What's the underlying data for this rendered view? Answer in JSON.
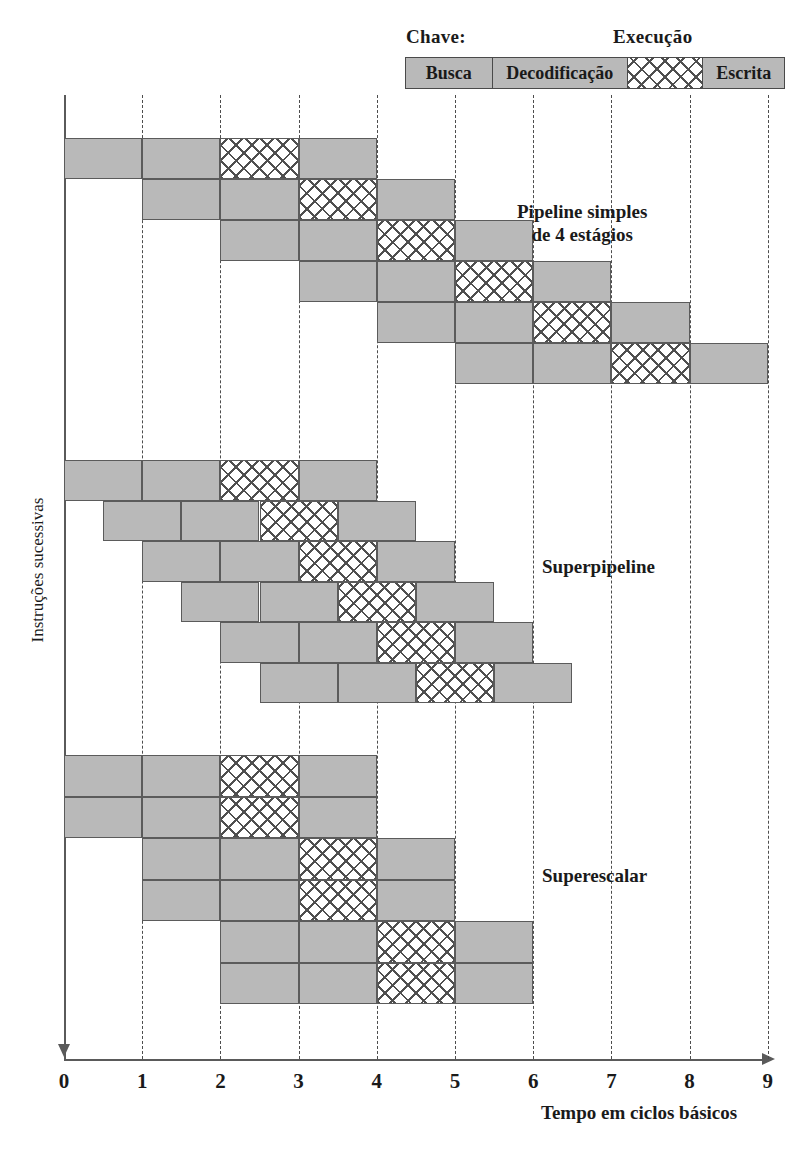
{
  "legend": {
    "key_label": "Chave:",
    "execution_label": "Execução",
    "cells": [
      {
        "name": "Busca",
        "pattern": "solid",
        "width_px": 86
      },
      {
        "name": "Decodificação",
        "pattern": "solid",
        "width_px": 136
      },
      {
        "name": "",
        "pattern": "hatch",
        "width_px": 76
      },
      {
        "name": "Escrita",
        "pattern": "solid",
        "width_px": 82
      }
    ]
  },
  "axes": {
    "x_caption": "Tempo em ciclos básicos",
    "y_caption": "Instruções sucessivas",
    "x_ticks": [
      "0",
      "1",
      "2",
      "3",
      "4",
      "5",
      "6",
      "7",
      "8",
      "9"
    ],
    "x_min": 0,
    "x_max": 9,
    "grid": "dashed-vertical"
  },
  "colors": {
    "fill_gray": "#b9b9b9",
    "stroke": "#5b5b5b",
    "axis": "#5a5a5a",
    "text": "#1a1a1a"
  },
  "chart_data": {
    "type": "bar",
    "title": "",
    "xlabel": "Tempo em ciclos básicos",
    "ylabel": "Instruções sucessivas",
    "xlim": [
      0,
      9
    ],
    "grid": true,
    "legend_position": "top-right",
    "stage_names": [
      "Busca",
      "Decodificação",
      "Execução",
      "Escrita"
    ],
    "stage_patterns": [
      "solid",
      "solid",
      "hatch",
      "solid"
    ],
    "groups": [
      {
        "label": "Pipeline simples\nde 4 estágios",
        "label_lines": [
          "Pipeline simples",
          "de 4 estágios"
        ],
        "row_count": 6,
        "rows": [
          {
            "start": 0,
            "stages": [
              [
                0,
                1
              ],
              [
                1,
                2
              ],
              [
                2,
                3
              ],
              [
                3,
                4
              ]
            ]
          },
          {
            "start": 1,
            "stages": [
              [
                1,
                2
              ],
              [
                2,
                3
              ],
              [
                3,
                4
              ],
              [
                4,
                5
              ]
            ]
          },
          {
            "start": 2,
            "stages": [
              [
                2,
                3
              ],
              [
                3,
                4
              ],
              [
                4,
                5
              ],
              [
                5,
                6
              ]
            ]
          },
          {
            "start": 3,
            "stages": [
              [
                3,
                4
              ],
              [
                4,
                5
              ],
              [
                5,
                6
              ],
              [
                6,
                7
              ]
            ]
          },
          {
            "start": 4,
            "stages": [
              [
                4,
                5
              ],
              [
                5,
                6
              ],
              [
                6,
                7
              ],
              [
                7,
                8
              ]
            ]
          },
          {
            "start": 5,
            "stages": [
              [
                5,
                6
              ],
              [
                6,
                7
              ],
              [
                7,
                8
              ],
              [
                8,
                9
              ]
            ]
          }
        ]
      },
      {
        "label": "Superpipeline",
        "label_lines": [
          "Superpipeline"
        ],
        "row_count": 6,
        "rows": [
          {
            "start": 0.0,
            "stages": [
              [
                0.0,
                1.0
              ],
              [
                1.0,
                2.0
              ],
              [
                2.0,
                3.0
              ],
              [
                3.0,
                4.0
              ]
            ]
          },
          {
            "start": 0.5,
            "stages": [
              [
                0.5,
                1.5
              ],
              [
                1.5,
                2.5
              ],
              [
                2.5,
                3.5
              ],
              [
                3.5,
                4.5
              ]
            ]
          },
          {
            "start": 1.0,
            "stages": [
              [
                1.0,
                2.0
              ],
              [
                2.0,
                3.0
              ],
              [
                3.0,
                4.0
              ],
              [
                4.0,
                5.0
              ]
            ]
          },
          {
            "start": 1.5,
            "stages": [
              [
                1.5,
                2.5
              ],
              [
                2.5,
                3.5
              ],
              [
                3.5,
                4.5
              ],
              [
                4.5,
                5.5
              ]
            ]
          },
          {
            "start": 2.0,
            "stages": [
              [
                2.0,
                3.0
              ],
              [
                3.0,
                4.0
              ],
              [
                4.0,
                5.0
              ],
              [
                5.0,
                6.0
              ]
            ]
          },
          {
            "start": 2.5,
            "stages": [
              [
                2.5,
                3.5
              ],
              [
                3.5,
                4.5
              ],
              [
                4.5,
                5.5
              ],
              [
                5.5,
                6.5
              ]
            ]
          }
        ]
      },
      {
        "label": "Superescalar",
        "label_lines": [
          "Superescalar"
        ],
        "row_count": 6,
        "rows": [
          {
            "start": 0,
            "stages": [
              [
                0,
                1
              ],
              [
                1,
                2
              ],
              [
                2,
                3
              ],
              [
                3,
                4
              ]
            ]
          },
          {
            "start": 0,
            "stages": [
              [
                0,
                1
              ],
              [
                1,
                2
              ],
              [
                2,
                3
              ],
              [
                3,
                4
              ]
            ]
          },
          {
            "start": 1,
            "stages": [
              [
                1,
                2
              ],
              [
                2,
                3
              ],
              [
                3,
                4
              ],
              [
                4,
                5
              ]
            ]
          },
          {
            "start": 1,
            "stages": [
              [
                1,
                2
              ],
              [
                2,
                3
              ],
              [
                3,
                4
              ],
              [
                4,
                5
              ]
            ]
          },
          {
            "start": 2,
            "stages": [
              [
                2,
                3
              ],
              [
                3,
                4
              ],
              [
                4,
                5
              ],
              [
                5,
                6
              ]
            ]
          },
          {
            "start": 2,
            "stages": [
              [
                2,
                3
              ],
              [
                3,
                4
              ],
              [
                4,
                5
              ],
              [
                5,
                6
              ]
            ]
          }
        ]
      }
    ]
  },
  "geometry": {
    "x0_px": 64,
    "unit_px": 78.2,
    "groups_top_px": [
      138,
      460,
      755
    ],
    "row_height_px": [
      41,
      40.5,
      41.5
    ],
    "group_label_pos": [
      {
        "left": 517,
        "top": 200
      },
      {
        "left": 542,
        "top": 555
      },
      {
        "left": 542,
        "top": 864
      }
    ]
  }
}
